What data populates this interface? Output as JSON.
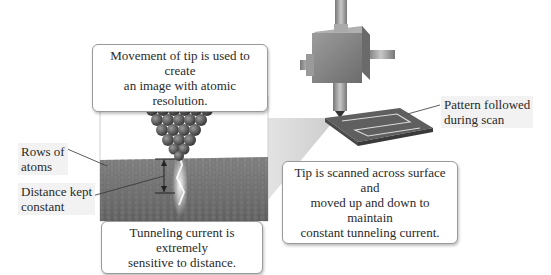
{
  "callouts": {
    "movement": {
      "line1": "Movement of tip is used to create",
      "line2": "an image with atomic resolution."
    },
    "tunneling": {
      "line1": "Tunneling current is extremely",
      "line2": "sensitive to distance."
    },
    "scanned": {
      "line1": "Tip is scanned across surface and",
      "line2": "moved up and down to maintain",
      "line3": "constant tunneling current."
    }
  },
  "labels": {
    "rows_of_atoms": {
      "line1": "Rows of",
      "line2": "atoms"
    },
    "distance": {
      "line1": "Distance kept",
      "line2": "constant"
    },
    "pattern": {
      "line1": "Pattern followed",
      "line2": "during scan"
    }
  },
  "colors": {
    "atom": "#5a5a5a",
    "surface": "#6e6e6e",
    "device": "#8a8a8a",
    "projection": "#d8d8d8"
  }
}
